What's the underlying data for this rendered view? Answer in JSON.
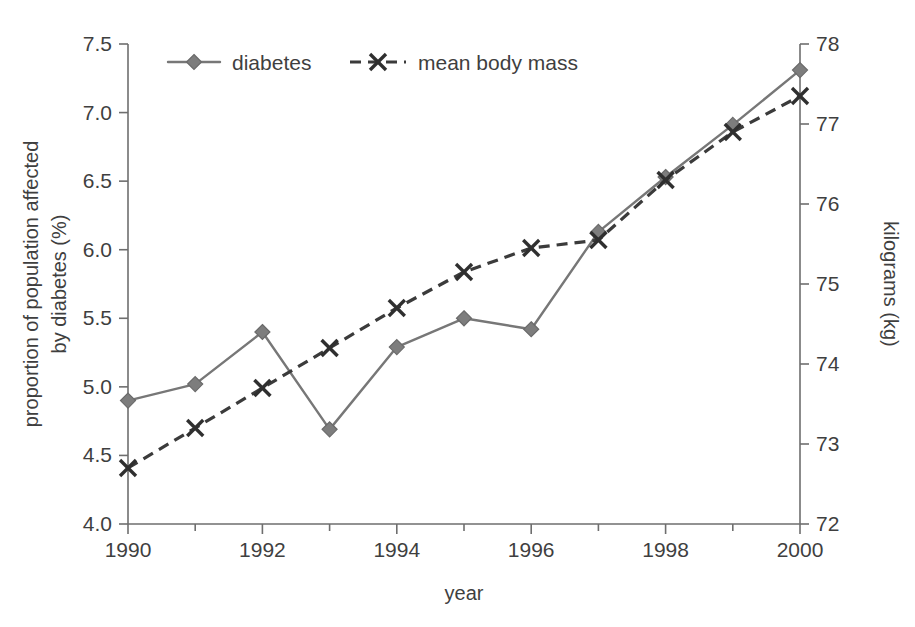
{
  "chart_data": {
    "type": "line",
    "title": "",
    "subtitle": "",
    "xlabel": "year",
    "ylabel": "proportion of population affected by diabetes (%)",
    "ylabel_lines": [
      "proportion of population affected",
      "by diabetes (%)"
    ],
    "y2label": "kilograms (kg)",
    "x": [
      1990,
      1991,
      1992,
      1993,
      1994,
      1995,
      1996,
      1997,
      1998,
      1999,
      2000
    ],
    "categories": [
      "1990",
      "1991",
      "1992",
      "1993",
      "1994",
      "1995",
      "1996",
      "1997",
      "1998",
      "1999",
      "2000"
    ],
    "xlim": [
      1990,
      2000
    ],
    "ylim": [
      4.0,
      7.5
    ],
    "y2lim": [
      72,
      78
    ],
    "xticks": [
      1990,
      1991,
      1992,
      1993,
      1994,
      1995,
      1996,
      1997,
      1998,
      1999,
      2000
    ],
    "xtick_labels": [
      "1990",
      "",
      "1992",
      "",
      "1994",
      "",
      "1996",
      "",
      "1998",
      "",
      "2000"
    ],
    "xtick_major_labels": [
      "1990",
      "1992",
      "1994",
      "1996",
      "1998",
      "2000"
    ],
    "yticks": [
      4.0,
      4.5,
      5.0,
      5.5,
      6.0,
      6.5,
      7.0,
      7.5
    ],
    "ytick_labels": [
      "4.0",
      "4.5",
      "5.0",
      "5.5",
      "6.0",
      "6.5",
      "7.0",
      "7.5"
    ],
    "y2ticks": [
      72,
      73,
      74,
      75,
      76,
      77,
      78
    ],
    "y2tick_labels": [
      "72",
      "73",
      "74",
      "75",
      "76",
      "77",
      "78"
    ],
    "grid": false,
    "legend_position": "top-left-inside",
    "series": [
      {
        "name": "diabetes",
        "axis": "left",
        "unit": "%",
        "marker": "diamond",
        "linestyle": "solid",
        "color": "#777777",
        "values": [
          4.9,
          5.02,
          5.4,
          4.69,
          5.29,
          5.5,
          5.42,
          6.13,
          6.53,
          6.91,
          7.31
        ]
      },
      {
        "name": "mean body mass",
        "axis": "right",
        "unit": "kg",
        "marker": "x",
        "linestyle": "dashed",
        "color": "#3b3b3b",
        "values": [
          72.7,
          73.2,
          73.7,
          74.2,
          74.7,
          75.15,
          75.45,
          75.55,
          76.3,
          76.9,
          77.35
        ]
      }
    ]
  },
  "legend": {
    "items": [
      {
        "label": "diabetes",
        "marker": "diamond-marker",
        "style": "solid"
      },
      {
        "label": "mean body mass",
        "marker": "x-marker",
        "style": "dashed"
      }
    ]
  },
  "colors": {
    "diabetes": "#777777",
    "mean_body_mass": "#3b3b3b",
    "axis": "#6e6e6e",
    "text": "#3f3f3f",
    "background": "#ffffff"
  }
}
